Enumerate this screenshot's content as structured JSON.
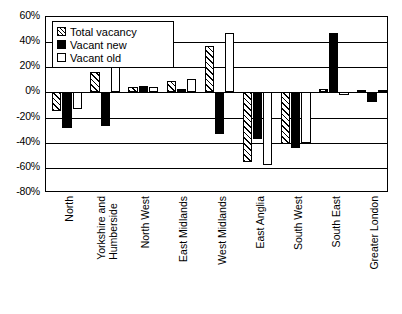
{
  "chart_data": {
    "type": "bar",
    "title": "",
    "subtitle": "",
    "xlabel": "",
    "ylabel": "",
    "ylim": [
      -80,
      60
    ],
    "ytick_values": [
      60,
      40,
      20,
      0,
      -20,
      -40,
      -60,
      -80
    ],
    "ytick_labels": [
      "60%",
      "40%",
      "20%",
      "0%",
      "-20%",
      "-40%",
      "-60%",
      "-80%"
    ],
    "grid": true,
    "legend_position": "top-left",
    "categories": [
      "North",
      "Yorkshire and Humberside",
      "North West",
      "East Midlands",
      "West Midlands",
      "East Anglia",
      "South West",
      "South East",
      "Greater London"
    ],
    "category_lines": [
      [
        "North"
      ],
      [
        "Yorkshire and",
        "Humberside"
      ],
      [
        "North West"
      ],
      [
        "East Midlands"
      ],
      [
        "West Midlands"
      ],
      [
        "East Anglia"
      ],
      [
        "South West"
      ],
      [
        "South East"
      ],
      [
        "Greater London"
      ]
    ],
    "series": [
      {
        "name": "Total vacancy",
        "style": "hatched",
        "values": [
          -15,
          16,
          4,
          9,
          37,
          -55,
          -41,
          3,
          2
        ]
      },
      {
        "name": "Vacant new",
        "style": "black",
        "values": [
          -28,
          -27,
          5,
          3,
          -33,
          -37,
          -44,
          47,
          -8
        ]
      },
      {
        "name": "Vacant old",
        "style": "white",
        "values": [
          -13,
          22,
          4,
          11,
          47,
          -58,
          -40,
          -2,
          2
        ]
      }
    ]
  },
  "legend": {
    "items": [
      {
        "label": "Total vacancy",
        "swatch": "hatched-swatch"
      },
      {
        "label": "Vacant new",
        "swatch": "black-swatch"
      },
      {
        "label": "Vacant old",
        "swatch": "white-swatch"
      }
    ]
  }
}
